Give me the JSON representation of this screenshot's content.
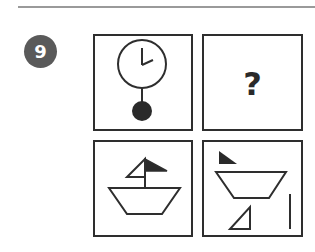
{
  "question": {
    "number": "9",
    "badge_color": "#5a5a5a"
  },
  "panels": [
    {
      "id": "top-left",
      "content": "pendulum-clock",
      "description": "Clock face with hands and pendulum with filled black bob"
    },
    {
      "id": "top-right",
      "content": "question-mark",
      "label": "?"
    },
    {
      "id": "bottom-left",
      "content": "sailboat",
      "description": "Boat hull (inverted trapezoid) with mast, white left sail and black right sail"
    },
    {
      "id": "bottom-right",
      "content": "sailboat-parts",
      "description": "Separated parts: black triangle, trapezoid hull, white triangle, vertical line"
    }
  ],
  "colors": {
    "stroke": "#2e2e2e",
    "fill_dark": "#2a2a2a",
    "rule": "#9a9a9a"
  }
}
